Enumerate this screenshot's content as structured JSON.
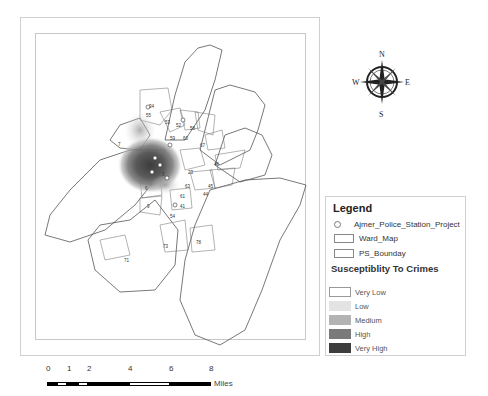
{
  "map": {
    "ward_labels": [
      "34",
      "55",
      "53",
      "52",
      "58",
      "59",
      "60",
      "67",
      "7",
      "46",
      "23",
      "45",
      "63",
      "44",
      "6",
      "9",
      "61",
      "41",
      "54",
      "73",
      "71",
      "78",
      "3"
    ],
    "colors": {
      "boundary": "#555555",
      "very_low": "#ffffff",
      "low": "#e3e3e3",
      "medium": "#b3b3b3",
      "high": "#7a7a7a",
      "very_high": "#3d3d3d"
    }
  },
  "compass": {
    "n": "N",
    "s": "S",
    "e": "E",
    "w": "W"
  },
  "legend": {
    "title": "Legend",
    "items": [
      {
        "label": "Ajmer_Police_Station_Project",
        "icon": "police-station-point-icon"
      },
      {
        "label": "Ward_Map",
        "icon": "ward-polygon-swatch"
      },
      {
        "label": "PS_Bounday",
        "icon": "ps-boundary-swatch"
      }
    ],
    "classes_title": "Susceptiblity To Crimes",
    "classes": [
      {
        "label": "Very Low",
        "color": "#ffffff"
      },
      {
        "label": "Low",
        "color": "#e3e3e3"
      },
      {
        "label": "Medium",
        "color": "#b3b3b3"
      },
      {
        "label": "High",
        "color": "#7a7a7a"
      },
      {
        "label": "Very High",
        "color": "#3d3d3d"
      }
    ]
  },
  "scale_bar": {
    "ticks": [
      "0",
      "1",
      "2",
      "4",
      "6",
      "8"
    ],
    "unit": "Miles"
  }
}
